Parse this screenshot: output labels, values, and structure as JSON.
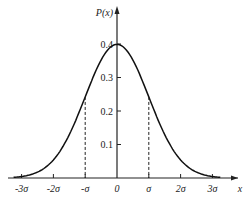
{
  "chart_data": {
    "type": "line",
    "title": "",
    "xlabel": "x",
    "ylabel": "P(x)",
    "x_ticks": [
      "-3σ",
      "-2σ",
      "-σ",
      "0",
      "σ",
      "2σ",
      "3σ"
    ],
    "y_ticks": [
      "0.1",
      "0.2",
      "0.3",
      "0.4"
    ],
    "ylim": [
      0,
      0.42
    ],
    "xlim": [
      -3.3,
      3.6
    ],
    "series": [
      {
        "name": "Normal density P(x)",
        "x": [
          -3,
          -2.5,
          -2,
          -1.5,
          -1,
          -0.5,
          0,
          0.5,
          1,
          1.5,
          2,
          2.5,
          3
        ],
        "values": [
          0.004,
          0.018,
          0.054,
          0.13,
          0.242,
          0.352,
          0.399,
          0.352,
          0.242,
          0.13,
          0.054,
          0.018,
          0.004
        ]
      }
    ],
    "annotations": [
      {
        "type": "dashed-vertical",
        "x": "-σ",
        "y_top": 0.242
      },
      {
        "type": "dashed-vertical",
        "x": "σ",
        "y_top": 0.242
      }
    ],
    "grid": false,
    "legend": "none"
  }
}
